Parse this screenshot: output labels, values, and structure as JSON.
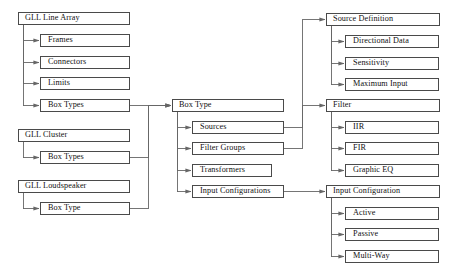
{
  "diagram": {
    "type": "hierarchy-tree",
    "style": {
      "box_border_color": "#4a4a4a",
      "box_fill_color": "#ffffff",
      "line_color": "#666666",
      "text_color": "#111111",
      "background_color": "#ffffff"
    },
    "nodes": [
      {
        "id": "gll_line_array",
        "label": "GLL Line Array",
        "x": 18,
        "y": 12,
        "w": 112,
        "root": true
      },
      {
        "id": "frames",
        "label": "Frames",
        "x": 40,
        "y": 34,
        "w": 90,
        "root": false
      },
      {
        "id": "connectors",
        "label": "Connectors",
        "x": 40,
        "y": 56,
        "w": 90,
        "root": false
      },
      {
        "id": "limits",
        "label": "Limits",
        "x": 40,
        "y": 77,
        "w": 90,
        "root": false
      },
      {
        "id": "box_types_line_array",
        "label": "Box Types",
        "x": 40,
        "y": 99,
        "w": 90,
        "root": false
      },
      {
        "id": "gll_cluster",
        "label": "GLL Cluster",
        "x": 18,
        "y": 129,
        "w": 112,
        "root": true
      },
      {
        "id": "box_types_cluster",
        "label": "Box Types",
        "x": 40,
        "y": 151,
        "w": 90,
        "root": false
      },
      {
        "id": "gll_loudspeaker",
        "label": "GLL Loudspeaker",
        "x": 18,
        "y": 180,
        "w": 112,
        "root": true
      },
      {
        "id": "box_type_loudspeaker",
        "label": "Box Type",
        "x": 40,
        "y": 202,
        "w": 90,
        "root": false
      },
      {
        "id": "box_type",
        "label": "Box Type",
        "x": 172,
        "y": 99,
        "w": 112,
        "root": true
      },
      {
        "id": "sources",
        "label": "Sources",
        "x": 192,
        "y": 121,
        "w": 92,
        "root": false
      },
      {
        "id": "filter_groups",
        "label": "Filter Groups",
        "x": 192,
        "y": 142,
        "w": 92,
        "root": false
      },
      {
        "id": "transformers",
        "label": "Transformers",
        "x": 192,
        "y": 164,
        "w": 80,
        "root": false
      },
      {
        "id": "input_configurations",
        "label": "Input Configurations",
        "x": 192,
        "y": 185,
        "w": 92,
        "root": false
      },
      {
        "id": "source_definition",
        "label": "Source Definition",
        "x": 326,
        "y": 13,
        "w": 114,
        "root": true
      },
      {
        "id": "directional_data",
        "label": "Directional Data",
        "x": 345,
        "y": 35,
        "w": 94,
        "root": false
      },
      {
        "id": "sensitivity",
        "label": "Sensitivity",
        "x": 345,
        "y": 57,
        "w": 94,
        "root": false
      },
      {
        "id": "maximum_input",
        "label": "Maximum Input",
        "x": 345,
        "y": 78,
        "w": 94,
        "root": false
      },
      {
        "id": "filter",
        "label": "Filter",
        "x": 326,
        "y": 99,
        "w": 114,
        "root": true
      },
      {
        "id": "iir",
        "label": "IIR",
        "x": 345,
        "y": 121,
        "w": 94,
        "root": false
      },
      {
        "id": "fir",
        "label": "FIR",
        "x": 345,
        "y": 142,
        "w": 94,
        "root": false
      },
      {
        "id": "graphic_eq",
        "label": "Graphic EQ",
        "x": 345,
        "y": 164,
        "w": 94,
        "root": false
      },
      {
        "id": "input_configuration",
        "label": "Input Configuration",
        "x": 326,
        "y": 185,
        "w": 114,
        "root": true
      },
      {
        "id": "active",
        "label": "Active",
        "x": 345,
        "y": 207,
        "w": 94,
        "root": false
      },
      {
        "id": "passive",
        "label": "Passive",
        "x": 345,
        "y": 228,
        "w": 94,
        "root": false
      },
      {
        "id": "multi_way",
        "label": "Multi-Way",
        "x": 345,
        "y": 250,
        "w": 94,
        "root": false
      }
    ],
    "edges": [
      {
        "from": "gll_line_array",
        "to": "frames"
      },
      {
        "from": "gll_line_array",
        "to": "connectors"
      },
      {
        "from": "gll_line_array",
        "to": "limits"
      },
      {
        "from": "gll_line_array",
        "to": "box_types_line_array"
      },
      {
        "from": "gll_cluster",
        "to": "box_types_cluster"
      },
      {
        "from": "gll_loudspeaker",
        "to": "box_type_loudspeaker"
      },
      {
        "from": "box_types_line_array",
        "to": "box_type"
      },
      {
        "from": "box_types_cluster",
        "to": "box_type"
      },
      {
        "from": "box_type_loudspeaker",
        "to": "box_type"
      },
      {
        "from": "box_type",
        "to": "sources"
      },
      {
        "from": "box_type",
        "to": "filter_groups"
      },
      {
        "from": "box_type",
        "to": "transformers"
      },
      {
        "from": "box_type",
        "to": "input_configurations"
      },
      {
        "from": "sources",
        "to": "source_definition"
      },
      {
        "from": "filter_groups",
        "to": "filter"
      },
      {
        "from": "input_configurations",
        "to": "input_configuration"
      },
      {
        "from": "source_definition",
        "to": "directional_data"
      },
      {
        "from": "source_definition",
        "to": "sensitivity"
      },
      {
        "from": "source_definition",
        "to": "maximum_input"
      },
      {
        "from": "filter",
        "to": "iir"
      },
      {
        "from": "filter",
        "to": "fir"
      },
      {
        "from": "filter",
        "to": "graphic_eq"
      },
      {
        "from": "input_configuration",
        "to": "active"
      },
      {
        "from": "input_configuration",
        "to": "passive"
      },
      {
        "from": "input_configuration",
        "to": "multi_way"
      }
    ]
  }
}
